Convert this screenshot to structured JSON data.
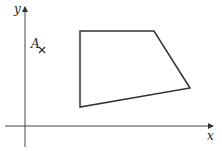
{
  "diagram": {
    "axes": {
      "x_label": "x",
      "y_label": "y",
      "origin": [
        25,
        126
      ],
      "x_axis": {
        "from": [
          5,
          126
        ],
        "to": [
          215,
          126
        ]
      },
      "y_axis": {
        "from": [
          25,
          147
        ],
        "to": [
          25,
          5
        ]
      }
    },
    "quadrilateral": {
      "vertices": [
        [
          80,
          31
        ],
        [
          154,
          31
        ],
        [
          190,
          88
        ],
        [
          80,
          107
        ]
      ],
      "stroke": "#333333"
    },
    "point": {
      "label": "A",
      "marker": "cross",
      "position": [
        42,
        50
      ]
    },
    "colors": {
      "axis": "#444444",
      "shape": "#333333"
    }
  }
}
